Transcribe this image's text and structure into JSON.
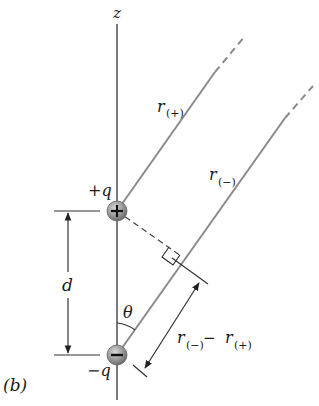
{
  "diagram": {
    "panel_label": "(b)",
    "axis_label": "z",
    "positive_charge_label": "+q",
    "negative_charge_label": "−q",
    "positive_charge_symbol": "+",
    "negative_charge_symbol": "−",
    "separation_label": "d",
    "angle_label": "θ",
    "r_plus_label": {
      "main": "r",
      "sub": "(+)"
    },
    "r_minus_label": {
      "main": "r",
      "sub": "(−)"
    },
    "path_difference_label": {
      "a_main": "r",
      "a_sub": "(−)",
      "op": " − ",
      "b_main": "r",
      "b_sub": "(+)"
    },
    "colors": {
      "line": "#333333",
      "ray": "#8a8a8a",
      "charge_sphere": "#8c8c8c",
      "charge_sphere_highlight": "#cfcfcf"
    }
  }
}
